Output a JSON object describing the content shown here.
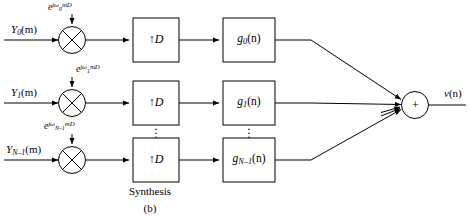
{
  "figure": {
    "caption_main": "Synthesis",
    "caption_sub": "(b)",
    "output_label_base": "v",
    "output_label_arg": "(n)"
  },
  "channels": [
    {
      "id": "channel-0",
      "input_label_base": "Y",
      "input_label_index": "0",
      "input_label_arg": "(m)",
      "modulator_exp_base": "e",
      "modulator_exp_jw": "jω",
      "modulator_exp_index": "0",
      "modulator_exp_tail": "mD",
      "modulator_symbol": "⊗",
      "upsampler_label": "↑D",
      "filter_label_base": "g",
      "filter_label_index": "0",
      "filter_label_arg": "(n)"
    },
    {
      "id": "channel-1",
      "input_label_base": "Y",
      "input_label_index": "1",
      "input_label_arg": "(m)",
      "modulator_exp_base": "e",
      "modulator_exp_jw": "jω",
      "modulator_exp_index": "1",
      "modulator_exp_tail": "mD",
      "modulator_symbol": "⊗",
      "upsampler_label": "↑D",
      "filter_label_base": "g",
      "filter_label_index": "1",
      "filter_label_arg": "(n)"
    },
    {
      "id": "channel-n-1",
      "input_label_base": "Y",
      "input_label_index": "N–1",
      "input_label_arg": "(m)",
      "modulator_exp_base": "e",
      "modulator_exp_jw": "jω",
      "modulator_exp_index": "N–1",
      "modulator_exp_tail": "mD",
      "modulator_symbol": "⊗",
      "upsampler_label": "↑D",
      "filter_label_base": "g",
      "filter_label_index": "N–1",
      "filter_label_arg": "(n)"
    }
  ],
  "adder": {
    "symbol": "+",
    "name": "summing-junction"
  },
  "ellipsis": {
    "glyph": "·"
  },
  "colors": {
    "line": "#000000",
    "background": "#ffffff",
    "text": "#000000"
  }
}
